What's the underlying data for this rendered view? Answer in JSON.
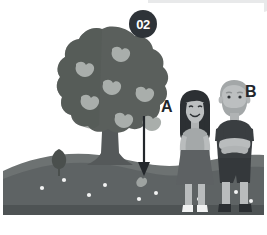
{
  "scene": {
    "title": "Apple tree falling fruit illustration",
    "step_badge": "02",
    "labels": {
      "person_a": "A",
      "person_b": "B"
    }
  },
  "colors": {
    "background": "#ffffff",
    "top_plate": "#e8e9ea",
    "badge_fill": "#2e3338",
    "badge_text": "#ffffff",
    "label_text": "#22262b",
    "canopy": "#5a5f5c",
    "canopy_shade": "#4d5250",
    "apple": "#a9aeab",
    "trunk": "#55595a",
    "ground_far": "#6d7272",
    "ground_near": "#595e5f",
    "ground_strip": "#4e5354",
    "bush": "#4a4f4d",
    "arrow": "#23272b",
    "flower": "#f2f3f3",
    "skin": "#b9bcbd",
    "hair_a": "#2c3033",
    "top_a": "#a4a8a9",
    "skirt_a": "#5d6163",
    "shoe_a": "#f1f2f2",
    "hair_b": "#a3a7a8",
    "shirt_b": "#3a3e41",
    "shorts_b": "#34383b",
    "shoe_b": "#2b2f32"
  },
  "elements": {
    "tree": "apple-tree",
    "bush": "small-shrub",
    "arrow": "downward-falling-arrow",
    "fallen_apple": "apple-on-ground",
    "person_a": "girl-standing",
    "person_b": "man-standing-arms-crossed",
    "ground": "grassy-hill",
    "flowers": "white-ground-flowers"
  },
  "counts": {
    "canopy_apples": 7,
    "ground_flowers": 9
  }
}
